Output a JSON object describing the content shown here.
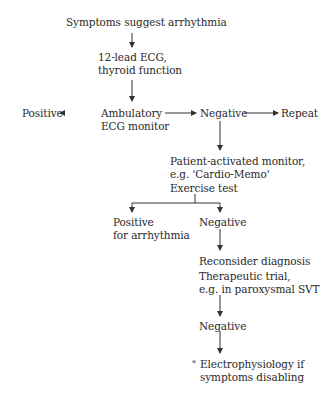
{
  "flowchart": {
    "start": "Symptoms suggest arrhythmia",
    "step1": {
      "line1": "12-lead ECG,",
      "line2": "thyroid function"
    },
    "step2": {
      "line1": "Ambulatory",
      "line2": "ECG monitor"
    },
    "step2_positive": "Positive",
    "step2_negative": "Negative",
    "repeat": "Repeat",
    "step3": {
      "line1": "Patient-activated monitor,",
      "line2": "e.g. 'Cardio-Memo'",
      "line3": "Exercise test"
    },
    "step3_positive": {
      "line1": "Positive",
      "line2": "for arrhythmia"
    },
    "step3_negative": "Negative",
    "step4": {
      "line1": "Reconsider diagnosis",
      "line2": "Therapeutic trial,",
      "line3": "e.g. in paroxysmal SVT"
    },
    "step4_negative": "Negative",
    "final": {
      "marker": "*",
      "line1": "Electrophysiology if",
      "line2": "symptoms disabling"
    }
  },
  "colors": {
    "text": "#2a2a2a",
    "line": "#333333",
    "background": "#ffffff"
  }
}
